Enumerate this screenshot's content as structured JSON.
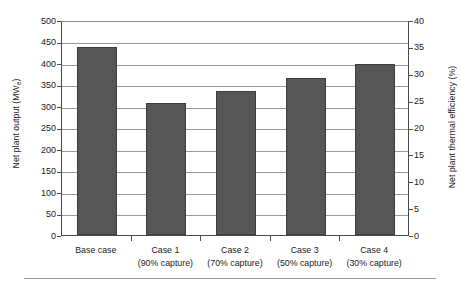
{
  "chart_data": {
    "type": "bar",
    "title": "",
    "xlabel": "",
    "ylabel": "Net plant output (MWe)",
    "ylabel_right": "Net plant thermal efficiency (%)",
    "categories": [
      "Base case",
      "Case 1",
      "Case 2",
      "Case 3",
      "Case 4"
    ],
    "category_sublabels": [
      "",
      "(90% capture)",
      "(70% capture)",
      "(50% capture)",
      "(30% capture)"
    ],
    "values": [
      438,
      307,
      336,
      366,
      398
    ],
    "series": [
      {
        "name": "Net plant output",
        "unit": "MWe",
        "values": [
          438,
          307,
          336,
          366,
          398
        ]
      }
    ],
    "ylim": [
      0,
      500
    ],
    "ylim_right": [
      0,
      40
    ],
    "yticks": [
      0,
      50,
      100,
      150,
      200,
      250,
      300,
      350,
      400,
      450,
      500
    ],
    "yticks_right": [
      0,
      5,
      10,
      15,
      20,
      25,
      30,
      35,
      40
    ],
    "grid": true,
    "legend": "none",
    "bar_color": "#565656",
    "bar_edge_color": "#3d3d3d",
    "grid_color": "#9a9a9a",
    "axis_color": "#4a4a4a"
  },
  "axes": {
    "left_title_main": "Net plant output (MW",
    "left_title_sub": "e",
    "left_title_close": ")",
    "right_title": "Net plant thermal efficiency (%)",
    "left_ticks": [
      "500",
      "450",
      "400",
      "350",
      "300",
      "250",
      "200",
      "150",
      "100",
      "50",
      "0"
    ],
    "right_ticks": [
      "40",
      "35",
      "30",
      "25",
      "20",
      "15",
      "10",
      "5",
      "0"
    ]
  },
  "categories": [
    {
      "label": "Base case",
      "sublabel": ""
    },
    {
      "label": "Case 1",
      "sublabel": "(90% capture)"
    },
    {
      "label": "Case 2",
      "sublabel": "(70% capture)"
    },
    {
      "label": "Case 3",
      "sublabel": "(50% capture)"
    },
    {
      "label": "Case 4",
      "sublabel": "(30% capture)"
    }
  ]
}
